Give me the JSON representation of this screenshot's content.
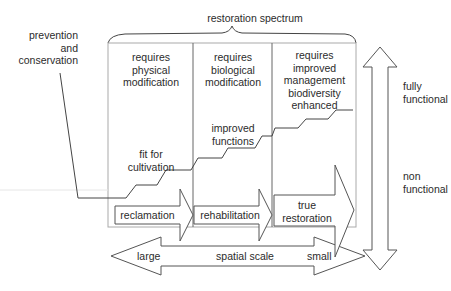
{
  "title": "restoration spectrum",
  "left_label": "prevention\nand\nconservation",
  "columns": [
    {
      "header": "requires\nphysical\nmodification",
      "level_label": "fit for\ncultivation",
      "arrow_label": "reclamation"
    },
    {
      "header": "requires\nbiological\nmodification",
      "level_label": "improved\nfunctions",
      "arrow_label": "rehabilitation"
    },
    {
      "header": "requires\nimproved\nmanagement\nbiodiversity\nenhanced",
      "level_label": "",
      "arrow_label": "true\nrestoration"
    }
  ],
  "vertical_axis": {
    "top": "fully\nfunctional",
    "bottom": "non\nfunctional"
  },
  "horizontal_axis": {
    "left": "large",
    "center": "spatial scale",
    "right": "small"
  },
  "colors": {
    "line": "#444444",
    "frame": "#9a9a9a",
    "text": "#2b2b2b"
  }
}
